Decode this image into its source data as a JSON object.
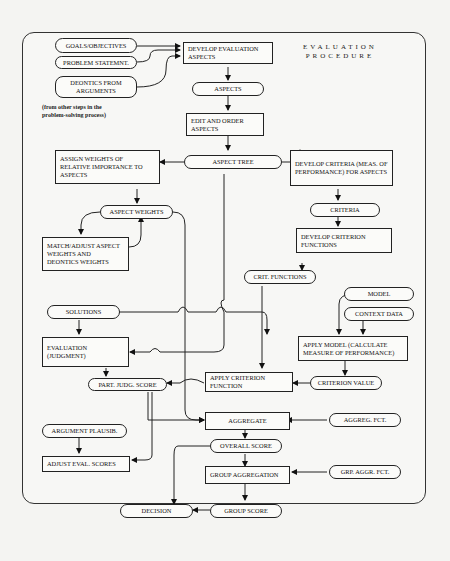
{
  "title": {
    "line1": "EVALUATION",
    "line2": "PROCEDURE"
  },
  "note": {
    "line1": "(from other steps in the",
    "line2": "problem-solving process)"
  },
  "nodes": {
    "goals": "GOALS/OBJECTIVES",
    "problem": "PROBLEM STATEMNT.",
    "deontics": "DEONTICS FROM ARGUMENTS",
    "develop_eval": "DEVELOP EVALUATION ASPECTS",
    "aspects": "ASPECTS",
    "edit_order": "EDIT AND ORDER ASPECTS",
    "aspect_tree": "ASPECT TREE",
    "assign_weights": "ASSIGN WEIGHTS OF RELATIVE IMPORTANCE TO ASPECTS",
    "develop_criteria": "DEVELOP CRITERIA (MEAS. OF PERFORMANCE) FOR ASPECTS",
    "aspect_weights": "ASPECT WEIGHTS",
    "criteria": "CRITERIA",
    "match_adjust": "MATCH/ADJUST ASPECT WEIGHTS AND DEONTICS WEIGHTS",
    "develop_crit_fn": "DEVELOP CRITERION FUNCTIONS",
    "crit_functions": "CRIT. FUNCTIONS",
    "solutions": "SOLUTIONS",
    "model": "MODEL",
    "context_data": "CONTEXT DATA",
    "evaluation": "EVALUATION (JUDGMENT)",
    "apply_model": "APPLY MODEL (CALCULATE MEASURE OF PERFORMANCE)",
    "part_judg": "PART. JUDG. SCORE",
    "apply_crit_fn": "APPLY CRITERION FUNCTION",
    "criterion_value": "CRITERION VALUE",
    "argument_plaus": "ARGUMENT PLAUSIB.",
    "aggregate": "AGGREGATE",
    "aggreg_fct": "AGGREG. FCT.",
    "adjust_eval": "ADJUST EVAL. SCORES",
    "overall_score": "OVERALL SCORE",
    "group_aggregation": "GROUP AGGREGATION",
    "grp_aggr_fct": "GRP. AGGR. FCT.",
    "decision": "DECISION",
    "group_score": "GROUP SCORE"
  }
}
